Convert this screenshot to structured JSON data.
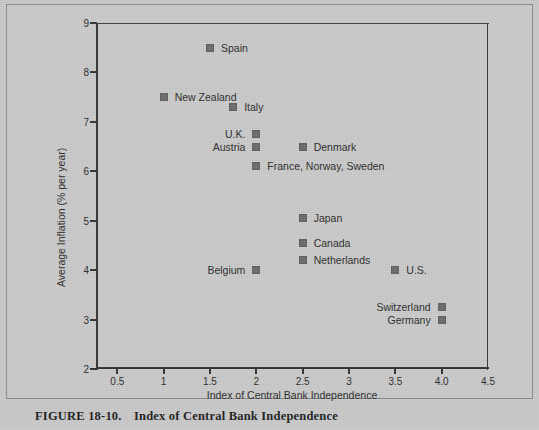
{
  "figure": {
    "caption_number": "FIGURE 18-10.",
    "caption_title": "Index of Central Bank Independence"
  },
  "chart_data": {
    "type": "scatter",
    "title": "",
    "xlabel": "Index of Central Bank Independence",
    "ylabel": "Average Inflation (% per year)",
    "xlim": [
      0.27,
      4.5
    ],
    "ylim": [
      2,
      9
    ],
    "xticks": [
      0.5,
      1,
      1.5,
      2,
      2.5,
      3,
      3.5,
      4,
      4.5
    ],
    "xtick_labels": [
      "0.5",
      "1",
      "1.5",
      "2",
      "2.5",
      "3",
      "3.5",
      "4.0",
      "4.5"
    ],
    "yticks": [
      2,
      3,
      4,
      5,
      6,
      7,
      8,
      9
    ],
    "ytick_labels": [
      "2",
      "3",
      "4",
      "5",
      "6",
      "7",
      "8",
      "9"
    ],
    "grid": false,
    "legend": "none",
    "marker_color": "#6b6b6b",
    "marker_shape": "square",
    "points": [
      {
        "label": "Spain",
        "x": 1.5,
        "y": 8.5,
        "label_side": "right"
      },
      {
        "label": "New Zealand",
        "x": 1.0,
        "y": 7.5,
        "label_side": "right"
      },
      {
        "label": "Italy",
        "x": 1.75,
        "y": 7.3,
        "label_side": "right"
      },
      {
        "label": "U.K.",
        "x": 2.0,
        "y": 6.75,
        "label_side": "left"
      },
      {
        "label": "Austria",
        "x": 2.0,
        "y": 6.5,
        "label_side": "left"
      },
      {
        "label": "Denmark",
        "x": 2.5,
        "y": 6.5,
        "label_side": "right"
      },
      {
        "label": "France, Norway, Sweden",
        "x": 2.0,
        "y": 6.1,
        "label_side": "right"
      },
      {
        "label": "Japan",
        "x": 2.5,
        "y": 5.05,
        "label_side": "right"
      },
      {
        "label": "Canada",
        "x": 2.5,
        "y": 4.55,
        "label_side": "right"
      },
      {
        "label": "Netherlands",
        "x": 2.5,
        "y": 4.2,
        "label_side": "right"
      },
      {
        "label": "Belgium",
        "x": 2.0,
        "y": 4.0,
        "label_side": "left"
      },
      {
        "label": "U.S.",
        "x": 3.5,
        "y": 4.0,
        "label_side": "right"
      },
      {
        "label": "Switzerland",
        "x": 4.0,
        "y": 3.25,
        "label_side": "left"
      },
      {
        "label": "Germany",
        "x": 4.0,
        "y": 3.0,
        "label_side": "left"
      }
    ]
  }
}
